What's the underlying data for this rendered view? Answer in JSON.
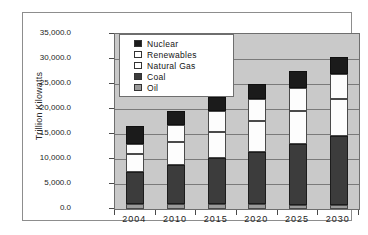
{
  "chart_data": {
    "type": "bar",
    "stacked": true,
    "title": "",
    "xlabel": "",
    "ylabel": "Trillion Kilowatts",
    "categories": [
      "2004",
      "2010",
      "2015",
      "2020",
      "2025",
      "2030"
    ],
    "ylim": [
      0,
      35000
    ],
    "ytick_step": 5000,
    "ytick_labels": [
      "0.0",
      "5,000.0",
      "10,000.0",
      "15,000.0",
      "20,000.0",
      "25,000.0",
      "30,000.0",
      "35,000.0"
    ],
    "ytick_values": [
      0,
      5000,
      10000,
      15000,
      20000,
      25000,
      30000,
      35000
    ],
    "grid": true,
    "legend_position": "top-left-inside",
    "series": [
      {
        "name": "Oil",
        "color": "#9a9a9a",
        "values": [
          1100,
          1000,
          1000,
          1000,
          900,
          800
        ]
      },
      {
        "name": "Coal",
        "color": "#3c3c3c",
        "values": [
          6400,
          7900,
          9300,
          10500,
          12200,
          13900
        ]
      },
      {
        "name": "Natural Gas",
        "color": "#ffffff",
        "values": [
          3500,
          4500,
          5100,
          6100,
          6600,
          7300
        ]
      },
      {
        "name": "Renewables",
        "color": "#ffffff",
        "values": [
          2000,
          3500,
          4300,
          4400,
          4500,
          5100
        ]
      },
      {
        "name": "Nuclear",
        "color": "#1b1b1b",
        "values": [
          3700,
          2700,
          2800,
          3100,
          3400,
          3400
        ]
      }
    ],
    "totals": [
      16700,
      19600,
      22500,
      25100,
      27600,
      30500
    ]
  },
  "legend": {
    "items": [
      {
        "label": "Nuclear",
        "swatch": "legend-swatch-nuclear"
      },
      {
        "label": "Renewables",
        "swatch": "legend-swatch-renewables"
      },
      {
        "label": "Natural Gas",
        "swatch": "legend-swatch-natural-gas"
      },
      {
        "label": "Coal",
        "swatch": "legend-swatch-coal"
      },
      {
        "label": "Oil",
        "swatch": "legend-swatch-oil"
      }
    ]
  }
}
